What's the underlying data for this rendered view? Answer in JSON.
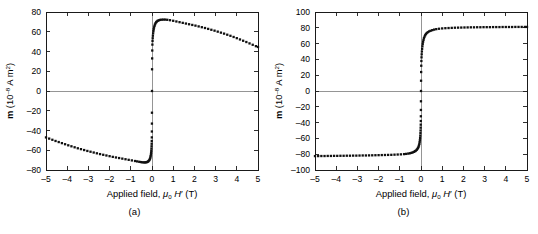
{
  "figure": {
    "panels": [
      {
        "id": "a",
        "caption": "(a)",
        "chart_data": {
          "type": "scatter",
          "title": "",
          "xlabel": "Applied field, μ0 H′ (T)",
          "ylabel": "m (10⁻⁸ A m²)",
          "xlabel_parts": {
            "prefix": "Applied field, ",
            "mu": "μ",
            "mu_sub": "0",
            "h": "H",
            "prime": "′",
            "unit": "(T)"
          },
          "ylabel_parts": {
            "sym": "m",
            "open": " (10",
            "exp": "–8",
            "rest": " A m",
            "sq": "2",
            "close": ")"
          },
          "xlim": [
            -5,
            5
          ],
          "ylim": [
            -80,
            80
          ],
          "xticks": [
            -5,
            -4,
            -3,
            -2,
            -1,
            0,
            1,
            2,
            3,
            4,
            5
          ],
          "yticks": [
            80,
            60,
            40,
            20,
            0,
            -20,
            -40,
            -60,
            -80
          ],
          "grid": false,
          "zero_lines": [
            "x",
            "y"
          ],
          "legend": null,
          "marker": "square",
          "series": [
            {
              "name": "magnetization with diamagnetic background",
              "x": [
                -5.0,
                -4.85,
                -4.7,
                -4.55,
                -4.4,
                -4.25,
                -4.1,
                -3.95,
                -3.8,
                -3.65,
                -3.5,
                -3.35,
                -3.2,
                -3.05,
                -2.9,
                -2.75,
                -2.6,
                -2.45,
                -2.3,
                -2.15,
                -2.0,
                -1.85,
                -1.7,
                -1.55,
                -1.4,
                -1.25,
                -1.1,
                -0.95,
                -0.8,
                -0.7,
                -0.6,
                -0.52,
                -0.45,
                -0.39,
                -0.33,
                -0.28,
                -0.24,
                -0.2,
                -0.17,
                -0.14,
                -0.115,
                -0.095,
                -0.078,
                -0.064,
                -0.052,
                -0.042,
                -0.034,
                -0.027,
                -0.021,
                -0.016,
                -0.012,
                -0.009,
                -0.006,
                -0.004,
                -0.002,
                0.0,
                0.003,
                0.007,
                0.012,
                0.018,
                0.025,
                0.033,
                0.042,
                0.053,
                0.066,
                0.081,
                0.098,
                0.118,
                0.14,
                0.165,
                0.195,
                0.23,
                0.27,
                0.32,
                0.38,
                0.45,
                0.53,
                0.62,
                0.72,
                0.85,
                1.0,
                1.15,
                1.3,
                1.45,
                1.6,
                1.75,
                1.9,
                2.05,
                2.2,
                2.35,
                2.5,
                2.65,
                2.8,
                2.95,
                3.1,
                3.25,
                3.4,
                3.55,
                3.7,
                3.85,
                4.0,
                4.15,
                4.3,
                4.45,
                4.6,
                4.75,
                4.9,
                5.0
              ],
              "y": [
                -47.0,
                -48.2,
                -49.4,
                -50.6,
                -51.7,
                -52.8,
                -53.9,
                -55.0,
                -56.0,
                -57.0,
                -58.0,
                -58.9,
                -59.8,
                -60.7,
                -61.5,
                -62.3,
                -63.1,
                -63.9,
                -64.6,
                -65.3,
                -66.0,
                -66.7,
                -67.3,
                -67.9,
                -68.5,
                -69.1,
                -69.7,
                -70.3,
                -70.9,
                -71.3,
                -71.7,
                -72.0,
                -72.2,
                -72.3,
                -72.3,
                -72.2,
                -72.0,
                -71.6,
                -71.1,
                -70.4,
                -69.6,
                -68.6,
                -67.4,
                -66.0,
                -64.4,
                -62.6,
                -60.6,
                -58.4,
                -56.0,
                -53.4,
                -50.6,
                -47.0,
                -41.0,
                -33.0,
                -22.0,
                0.0,
                22.0,
                33.0,
                41.0,
                47.0,
                50.6,
                53.4,
                56.0,
                58.4,
                60.6,
                62.6,
                64.4,
                66.0,
                67.4,
                68.6,
                69.6,
                70.4,
                71.1,
                71.6,
                72.0,
                72.2,
                72.3,
                72.3,
                72.1,
                71.7,
                71.1,
                70.4,
                69.7,
                69.0,
                68.3,
                67.6,
                66.9,
                66.2,
                65.4,
                64.6,
                63.8,
                62.9,
                62.0,
                61.1,
                60.1,
                59.1,
                58.1,
                57.0,
                55.9,
                54.7,
                53.5,
                52.2,
                50.9,
                49.6,
                48.2,
                46.8,
                45.4,
                44.6
              ]
            }
          ]
        }
      },
      {
        "id": "b",
        "caption": "(b)",
        "chart_data": {
          "type": "scatter",
          "title": "",
          "xlabel": "Applied field, μ0 H′ (T)",
          "ylabel": "m (10⁻⁸ A m²)",
          "xlabel_parts": {
            "prefix": "Applied field, ",
            "mu": "μ",
            "mu_sub": "0",
            "h": "H",
            "prime": "′",
            "unit": "(T)"
          },
          "ylabel_parts": {
            "sym": "m",
            "open": " (10",
            "exp": "–8",
            "rest": " A m",
            "sq": "2",
            "close": ")"
          },
          "xlim": [
            -5,
            5
          ],
          "ylim": [
            -100,
            100
          ],
          "xticks": [
            -5,
            -4,
            -3,
            -2,
            -1,
            0,
            1,
            2,
            3,
            4,
            5
          ],
          "yticks": [
            100,
            80,
            60,
            40,
            20,
            0,
            -20,
            -40,
            -60,
            -80,
            -100
          ],
          "grid": false,
          "zero_lines": [
            "x",
            "y"
          ],
          "legend": null,
          "marker": "square",
          "series": [
            {
              "name": "magnetization after diamagnetic correction",
              "x": [
                -5.0,
                -4.85,
                -4.7,
                -4.55,
                -4.4,
                -4.25,
                -4.1,
                -3.95,
                -3.8,
                -3.65,
                -3.5,
                -3.35,
                -3.2,
                -3.05,
                -2.9,
                -2.75,
                -2.6,
                -2.45,
                -2.3,
                -2.15,
                -2.0,
                -1.85,
                -1.7,
                -1.55,
                -1.4,
                -1.25,
                -1.1,
                -0.95,
                -0.8,
                -0.7,
                -0.6,
                -0.52,
                -0.45,
                -0.39,
                -0.33,
                -0.28,
                -0.24,
                -0.2,
                -0.17,
                -0.14,
                -0.115,
                -0.095,
                -0.078,
                -0.064,
                -0.052,
                -0.042,
                -0.034,
                -0.027,
                -0.021,
                -0.016,
                -0.012,
                -0.009,
                -0.006,
                -0.004,
                -0.002,
                0.0,
                0.003,
                0.007,
                0.012,
                0.018,
                0.025,
                0.033,
                0.042,
                0.053,
                0.066,
                0.081,
                0.098,
                0.118,
                0.14,
                0.165,
                0.195,
                0.23,
                0.27,
                0.32,
                0.38,
                0.45,
                0.53,
                0.62,
                0.72,
                0.85,
                1.0,
                1.15,
                1.3,
                1.45,
                1.6,
                1.75,
                1.9,
                2.05,
                2.2,
                2.35,
                2.5,
                2.65,
                2.8,
                2.95,
                3.1,
                3.25,
                3.4,
                3.55,
                3.7,
                3.85,
                4.0,
                4.15,
                4.3,
                4.45,
                4.6,
                4.75,
                4.9,
                5.0
              ],
              "y": [
                -82.4,
                -82.4,
                -82.3,
                -82.3,
                -82.2,
                -82.2,
                -82.1,
                -82.1,
                -82.0,
                -82.0,
                -81.9,
                -81.9,
                -81.8,
                -81.8,
                -81.7,
                -81.6,
                -81.6,
                -81.5,
                -81.4,
                -81.3,
                -81.2,
                -81.1,
                -81.0,
                -80.9,
                -80.8,
                -80.6,
                -80.4,
                -80.2,
                -79.9,
                -79.6,
                -79.2,
                -78.8,
                -78.3,
                -77.7,
                -77.0,
                -76.2,
                -75.4,
                -74.4,
                -73.3,
                -72.0,
                -70.5,
                -68.8,
                -66.9,
                -64.7,
                -62.3,
                -59.6,
                -56.6,
                -53.4,
                -50.0,
                -46.4,
                -42.6,
                -38.0,
                -32.0,
                -24.0,
                -13.0,
                0.0,
                13.0,
                24.0,
                32.0,
                38.0,
                42.6,
                46.4,
                50.0,
                53.4,
                56.6,
                59.6,
                62.3,
                64.7,
                66.9,
                68.8,
                70.5,
                72.0,
                73.3,
                74.4,
                75.4,
                76.2,
                77.0,
                77.7,
                78.3,
                78.8,
                79.2,
                79.5,
                79.7,
                79.9,
                80.1,
                80.2,
                80.3,
                80.4,
                80.5,
                80.6,
                80.6,
                80.7,
                80.7,
                80.8,
                80.8,
                80.8,
                80.9,
                80.9,
                80.9,
                81.0,
                81.0,
                81.0,
                81.0,
                81.1,
                81.1,
                81.1,
                81.1,
                81.1
              ]
            }
          ]
        }
      }
    ]
  }
}
